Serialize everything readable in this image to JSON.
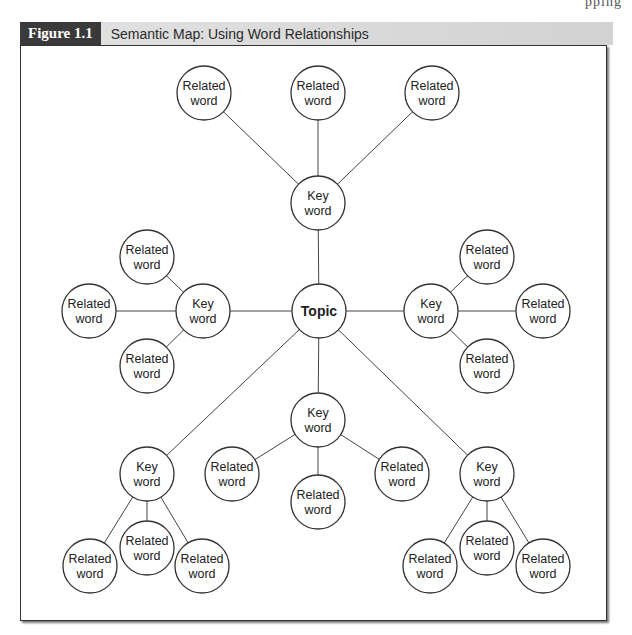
{
  "page": {
    "running_head": "pping"
  },
  "figure": {
    "label": "Figure 1.1",
    "title": "Semantic Map: Using Word Relationships"
  },
  "diagram": {
    "node_radius": 27,
    "topic": {
      "id": "topic",
      "lines": [
        "Topic"
      ],
      "x": 319,
      "y": 311
    },
    "clusters": [
      {
        "name": "top",
        "key": {
          "lines": [
            "Key",
            "word"
          ],
          "x": 318,
          "y": 203
        },
        "related": [
          {
            "lines": [
              "Related",
              "word"
            ],
            "x": 204,
            "y": 93
          },
          {
            "lines": [
              "Related",
              "word"
            ],
            "x": 318,
            "y": 93
          },
          {
            "lines": [
              "Related",
              "word"
            ],
            "x": 432,
            "y": 93
          }
        ]
      },
      {
        "name": "left",
        "key": {
          "lines": [
            "Key",
            "word"
          ],
          "x": 203,
          "y": 311
        },
        "related": [
          {
            "lines": [
              "Related",
              "word"
            ],
            "x": 147,
            "y": 257
          },
          {
            "lines": [
              "Related",
              "word"
            ],
            "x": 89,
            "y": 311
          },
          {
            "lines": [
              "Related",
              "word"
            ],
            "x": 147,
            "y": 366
          }
        ]
      },
      {
        "name": "right",
        "key": {
          "lines": [
            "Key",
            "word"
          ],
          "x": 431,
          "y": 311
        },
        "related": [
          {
            "lines": [
              "Related",
              "word"
            ],
            "x": 487,
            "y": 257
          },
          {
            "lines": [
              "Related",
              "word"
            ],
            "x": 543,
            "y": 311
          },
          {
            "lines": [
              "Related",
              "word"
            ],
            "x": 487,
            "y": 366
          }
        ]
      },
      {
        "name": "bottom-center",
        "key": {
          "lines": [
            "Key",
            "word"
          ],
          "x": 318,
          "y": 420
        },
        "related": [
          {
            "lines": [
              "Related",
              "word"
            ],
            "x": 232,
            "y": 474
          },
          {
            "lines": [
              "Related",
              "word"
            ],
            "x": 318,
            "y": 502
          },
          {
            "lines": [
              "Related",
              "word"
            ],
            "x": 402,
            "y": 474
          }
        ]
      },
      {
        "name": "bottom-left",
        "key": {
          "lines": [
            "Key",
            "word"
          ],
          "x": 147,
          "y": 474
        },
        "related": [
          {
            "lines": [
              "Related",
              "word"
            ],
            "x": 90,
            "y": 566
          },
          {
            "lines": [
              "Related",
              "word"
            ],
            "x": 147,
            "y": 548
          },
          {
            "lines": [
              "Related",
              "word"
            ],
            "x": 202,
            "y": 566
          }
        ]
      },
      {
        "name": "bottom-right",
        "key": {
          "lines": [
            "Key",
            "word"
          ],
          "x": 487,
          "y": 474
        },
        "related": [
          {
            "lines": [
              "Related",
              "word"
            ],
            "x": 430,
            "y": 566
          },
          {
            "lines": [
              "Related",
              "word"
            ],
            "x": 487,
            "y": 548
          },
          {
            "lines": [
              "Related",
              "word"
            ],
            "x": 543,
            "y": 566
          }
        ]
      }
    ]
  }
}
